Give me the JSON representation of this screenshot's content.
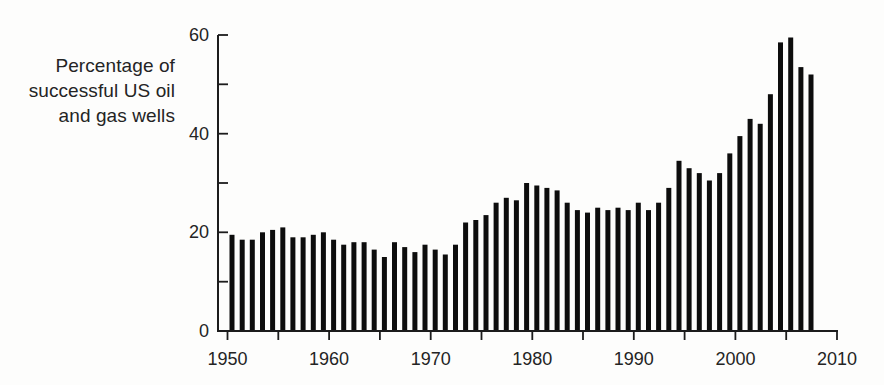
{
  "chart_data": {
    "type": "bar",
    "title": "",
    "ylabel": "Percentage of successful US oil and gas wells",
    "ylabel_lines": [
      "Percentage of",
      "successful US oil",
      "and gas wells"
    ],
    "xlabel": "",
    "x": [
      1950,
      1951,
      1952,
      1953,
      1954,
      1955,
      1956,
      1957,
      1958,
      1959,
      1960,
      1961,
      1962,
      1963,
      1964,
      1965,
      1966,
      1967,
      1968,
      1969,
      1970,
      1971,
      1972,
      1973,
      1974,
      1975,
      1976,
      1977,
      1978,
      1979,
      1980,
      1981,
      1982,
      1983,
      1984,
      1985,
      1986,
      1987,
      1988,
      1989,
      1990,
      1991,
      1992,
      1993,
      1994,
      1995,
      1996,
      1997,
      1998,
      1999,
      2000,
      2001,
      2002,
      2003,
      2004,
      2005,
      2006,
      2007
    ],
    "values": [
      19.5,
      18.5,
      18.5,
      20,
      20.5,
      21,
      19,
      19,
      19.5,
      20,
      18.5,
      17.5,
      18,
      18,
      16.5,
      15,
      18,
      17,
      16,
      17.5,
      16.5,
      15.5,
      17.5,
      22,
      22.5,
      23.5,
      26,
      27,
      26.5,
      30,
      29.5,
      29,
      28.5,
      26,
      24.5,
      24,
      25,
      24.5,
      25,
      24.5,
      26,
      24.5,
      26,
      29,
      34.5,
      33,
      32,
      30.5,
      32,
      36,
      39.5,
      43,
      42,
      48,
      58.5,
      59.5,
      53.5,
      52
    ],
    "xlim": [
      1950,
      2010
    ],
    "ylim": [
      0,
      60
    ],
    "x_tick_step": 5,
    "x_label_ticks": [
      1950,
      1960,
      1970,
      1980,
      1990,
      2000,
      2010
    ],
    "y_tick_step": 10,
    "y_label_ticks": [
      0,
      20,
      40,
      60
    ],
    "grid": false,
    "legend": null,
    "bar_color": "#0d0d0d",
    "axis_color": "#1c1c1c",
    "text_color": "#242424",
    "background": "#fdfdfc"
  }
}
